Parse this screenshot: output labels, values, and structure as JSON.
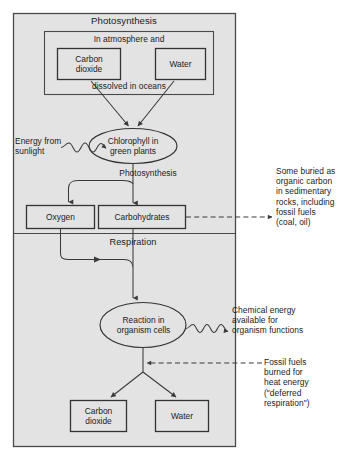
{
  "figure": {
    "background_color": "#ffffff",
    "panel_fill": "#e3e3e3",
    "line_color": "#3a3a3a",
    "text_color": "#1b1b1b"
  },
  "sections": {
    "photosynthesis_title": "Photosynthesis",
    "respiration_title": "Respiration"
  },
  "reservoir_box": {
    "top_label": "In atmosphere and",
    "bottom_label": "dissolved in oceans",
    "items": [
      {
        "label": "Carbon\ndioxide"
      },
      {
        "label": "Water"
      }
    ]
  },
  "nodes": {
    "chlorophyll": "Chlorophyll in\ngreen plants",
    "reaction": "Reaction in\norganism cells",
    "oxygen": "Oxygen",
    "carbohydrates": "Carbohydrates",
    "carbon_dioxide_out": "Carbon\ndioxide",
    "water_out": "Water"
  },
  "process_labels": {
    "photosynthesis_step": "Photosynthesis"
  },
  "annotations": {
    "energy_from_sunlight": "Energy from\nsunlight",
    "buried_carbon": "Some buried as\norganic carbon\nin sedimentary\nrocks, including\nfossil fuels\n(coal, oil)",
    "chemical_energy": "Chemical energy\navailable for\norganism functions",
    "fossil_fuels_burned": "Fossil fuels\nburned for\nheat energy\n(\"deferred\nrespiration\")"
  }
}
